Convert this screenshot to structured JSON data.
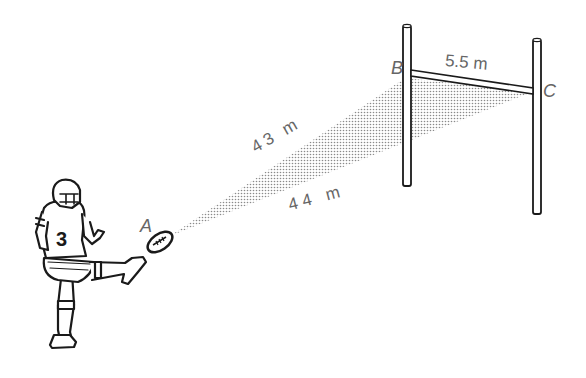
{
  "diagram": {
    "points": {
      "A": "A",
      "B": "B",
      "C": "C"
    },
    "distances": {
      "AB": "43 m",
      "AC": "44 m",
      "BC": "5.5 m"
    },
    "player": {
      "jersey_number": "3"
    },
    "colors": {
      "line": "#1a1a1a",
      "label": "#666666",
      "shade": "#9a9a9a"
    }
  }
}
